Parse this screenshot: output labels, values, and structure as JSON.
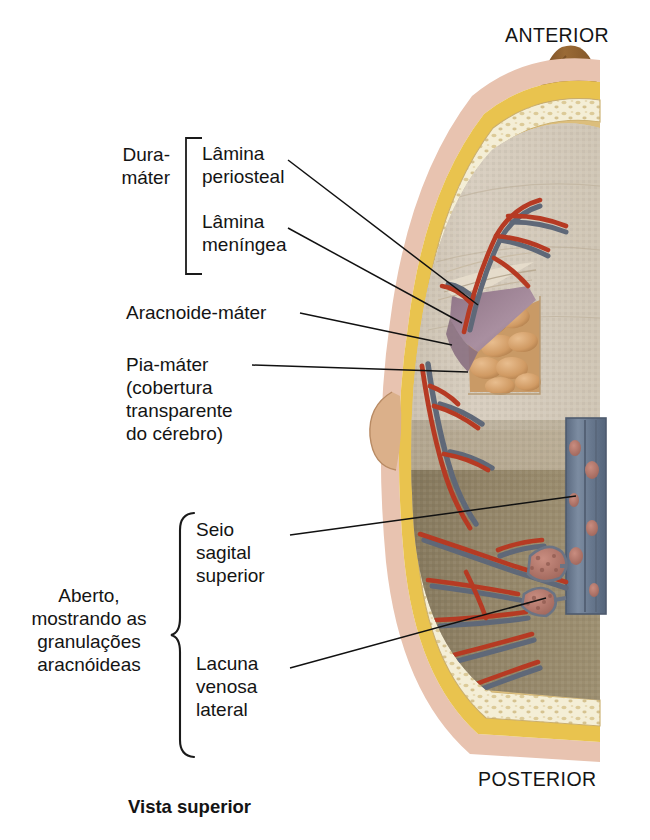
{
  "figure": {
    "title_caption": "Vista superior",
    "orientation": {
      "anterior": "ANTERIOR",
      "posterior": "POSTERIOR"
    },
    "labels": {
      "dura_group": "Dura-\nmáter",
      "dura_sub_1": "Lâmina\nperiosteal",
      "dura_sub_2": "Lâmina\nmeníngea",
      "arachnoid": "Aracnoide-máter",
      "pia": "Pia-máter\n(cobertura\ntransparente\ndo cérebro)",
      "open_group": "Aberto,\nmostrando as\ngranulações\naracnóideas",
      "sinus": "Seio\nsagital\nsuperior",
      "lacuna": "Lacuna\nvenosa\nlateral"
    },
    "colors": {
      "scalp": "#e8c3b0",
      "outer_table": "#e9c34e",
      "diploe": "#f3ecd2",
      "inner_table": "#dfc07a",
      "brain_light": "#d9cfc0",
      "brain_dark": "#8d7f63",
      "gyri": "#d9a472",
      "arachnoid_flap": "#9d8293",
      "artery": "#b63a23",
      "vein": "#5f6878",
      "sinus_lumen": "#6e7f93",
      "granulation": "#b0736a",
      "frontal_bump": "#8a5a30",
      "leader_line": "#111111"
    }
  }
}
